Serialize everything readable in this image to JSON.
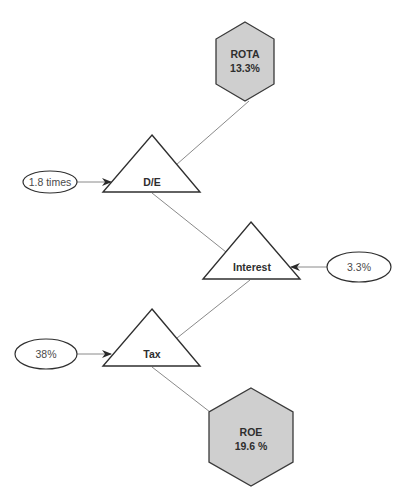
{
  "diagram": {
    "nodes": {
      "rota": {
        "label": "ROTA",
        "value": "13.3%"
      },
      "de": {
        "label": "D/E"
      },
      "interest": {
        "label": "Interest"
      },
      "tax": {
        "label": "Tax"
      },
      "roe": {
        "label": "ROE",
        "value": "19.6 %"
      }
    },
    "inputs": {
      "de_input": "1.8 times",
      "interest_input": "3.3%",
      "tax_input": "38%"
    },
    "colors": {
      "hexagon_fill": "#cfcfcf",
      "outline": "#2f2f2f",
      "connector": "#8a8a8a"
    }
  }
}
